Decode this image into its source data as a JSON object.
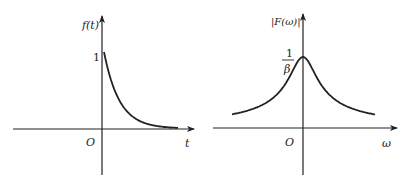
{
  "left_plot": {
    "title": "Exponential decay in time domain",
    "y_label": "f(t)",
    "x_label": "t",
    "origin_label": "O",
    "y_tick_label": "1",
    "function": "f(t) = e^{-βt}, t ≥ 0",
    "start_value": 1
  },
  "right_plot": {
    "title": "Magnitude spectrum",
    "y_label": "|F(ω)|",
    "x_label": "ω",
    "origin_label": "O",
    "peak_label_numerator": "1",
    "peak_label_denominator": "β",
    "function": "|F(ω)| = 1/sqrt(β² + ω²)"
  },
  "colors": {
    "line": "#222222",
    "background": "#ffffff"
  }
}
